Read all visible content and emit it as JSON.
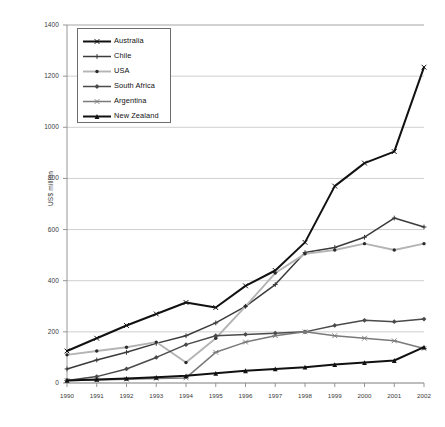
{
  "chart_data": {
    "type": "line",
    "title": "",
    "subtitle": "",
    "xlabel": "",
    "ylabel": "US$ million",
    "grid": true,
    "legend_position": "top-left",
    "xlim": [
      1990,
      2002
    ],
    "ylim": [
      0,
      1400
    ],
    "ytick_step": 200,
    "yticks": [
      0,
      200,
      400,
      600,
      800,
      1000,
      1200,
      1400
    ],
    "categories": [
      "1990",
      "1991",
      "1992",
      "1993",
      "1994",
      "1995",
      "1996",
      "1997",
      "1998",
      "1999",
      "2000",
      "2001",
      "2002"
    ],
    "series": [
      {
        "name": "Australia",
        "marker": "x",
        "color": "#111111",
        "values": [
          125,
          175,
          225,
          270,
          315,
          295,
          380,
          440,
          550,
          770,
          860,
          905,
          1235
        ]
      },
      {
        "name": "Chile",
        "marker": "plus",
        "color": "#3b3b3b",
        "values": [
          55,
          90,
          120,
          155,
          185,
          235,
          300,
          385,
          510,
          530,
          570,
          645,
          610
        ]
      },
      {
        "name": "USA",
        "marker": "dot",
        "color": "#b4b4b4",
        "values": [
          110,
          125,
          140,
          160,
          80,
          175,
          300,
          430,
          505,
          520,
          545,
          520,
          545
        ]
      },
      {
        "name": "South Africa",
        "marker": "diamond",
        "color": "#4a4a4a",
        "values": [
          10,
          25,
          55,
          100,
          150,
          185,
          190,
          195,
          200,
          225,
          245,
          240,
          250
        ]
      },
      {
        "name": "Argentina",
        "marker": "star",
        "color": "#7a7a7a",
        "values": [
          10,
          12,
          15,
          18,
          20,
          120,
          160,
          185,
          200,
          185,
          175,
          165,
          135
        ]
      },
      {
        "name": "New Zealand",
        "marker": "triangle",
        "color": "#111111",
        "values": [
          10,
          14,
          18,
          22,
          28,
          38,
          48,
          55,
          62,
          72,
          80,
          88,
          140
        ]
      }
    ]
  },
  "axes": {
    "ylabel": "US$ million",
    "ytick_labels": [
      "1400",
      "1200",
      "1000",
      "800",
      "600",
      "400",
      "200",
      "0"
    ],
    "xtick_labels": [
      "1990",
      "1991",
      "1992",
      "1993",
      "1994",
      "1995",
      "1996",
      "1997",
      "1998",
      "1999",
      "2000",
      "2001",
      "2002"
    ]
  },
  "legend": {
    "items": [
      {
        "label": "Australia"
      },
      {
        "label": "Chile"
      },
      {
        "label": "USA"
      },
      {
        "label": "South Africa"
      },
      {
        "label": "Argentina"
      },
      {
        "label": "New Zealand"
      }
    ]
  }
}
